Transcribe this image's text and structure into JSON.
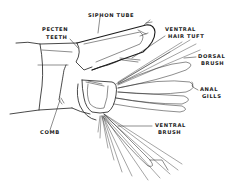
{
  "diagram": {
    "colors": {
      "ink": "#1c1c1c",
      "background": "#ffffff"
    },
    "labels": {
      "siphon_tube": "SIPHON TUBE",
      "pecten_teeth_1": "PECTEN",
      "pecten_teeth_2": "TEETH",
      "ventral_hair_tuft_1": "VENTRAL",
      "ventral_hair_tuft_2": "HAIR TUFT",
      "dorsal_brush_1": "DORSAL",
      "dorsal_brush_2": "BRUSH",
      "anal_gills_1": "ANAL",
      "anal_gills_2": "GILLS",
      "comb": "COMB",
      "ventral_brush_1": "VENTRAL",
      "ventral_brush_2": "BRUSH"
    }
  }
}
